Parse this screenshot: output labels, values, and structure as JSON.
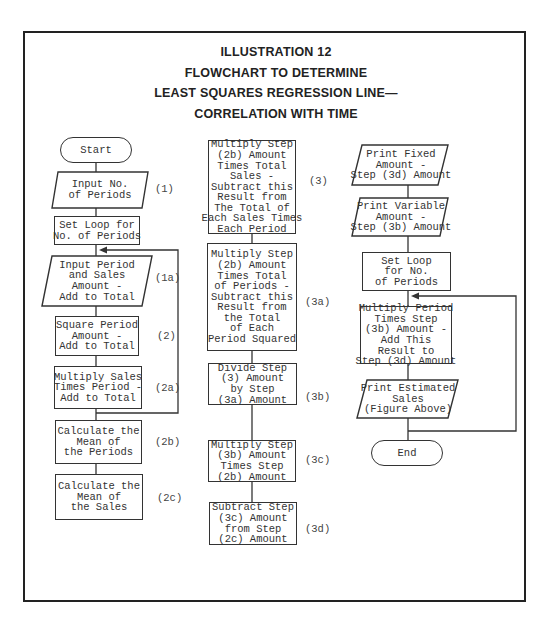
{
  "title": {
    "line1": "ILLUSTRATION 12",
    "line2": "FLOWCHART TO DETERMINE",
    "line3": "LEAST SQUARES REGRESSION LINE—",
    "line4": "CORRELATION WITH TIME"
  },
  "left_column": {
    "start": "Start",
    "input_periods": {
      "text": "Input No.\nof Periods",
      "step": "(1)"
    },
    "set_loop": {
      "text": "Set Loop for\nNo. of Periods"
    },
    "input_period_sales": {
      "text": "Input Period\nand Sales\nAmount -\nAdd to Total",
      "step": "(1a)"
    },
    "square_period": {
      "text": "Square Period\nAmount -\nAdd to Total",
      "step": "(2)"
    },
    "multiply_sales": {
      "text": "Multiply Sales\nTimes Period -\nAdd to Total",
      "step": "(2a)"
    },
    "mean_periods": {
      "text": "Calculate the\nMean of\nthe Periods",
      "step": "(2b)"
    },
    "mean_sales": {
      "text": "Calculate the\nMean of\nthe Sales",
      "step": "(2c)"
    }
  },
  "middle_column": {
    "step3": {
      "text": "Multiply Step\n(2b) Amount\nTimes Total\nSales -\nSubtract this\nResult from\nThe Total of\nEach Sales Times\nEach Period",
      "step": "(3)"
    },
    "step3a": {
      "text": "Multiply Step\n(2b) Amount\nTimes Total\nof Periods -\nSubtract this\nResult from\nthe Total\nof Each\nPeriod Squared",
      "step": "(3a)"
    },
    "step3b": {
      "text": "Divide Step\n(3) Amount\nby Step\n(3a) Amount",
      "step": "(3b)"
    },
    "step3c": {
      "text": "Multiply Step\n(3b) Amount\nTimes Step\n(2b) Amount",
      "step": "(3c)"
    },
    "step3d": {
      "text": "Subtract Step\n(3c) Amount\nfrom Step\n(2c) Amount",
      "step": "(3d)"
    }
  },
  "right_column": {
    "print_fixed": {
      "text": "Print Fixed\nAmount -\nStep (3d) Amount"
    },
    "print_variable": {
      "text": "Print Variable\nAmount -\nStep (3b) Amount"
    },
    "set_loop": {
      "text": "Set Loop\nfor No.\nof Periods"
    },
    "multiply_period": {
      "text": "Multiply Period\nTimes Step\n(3b) Amount -\nAdd This\nResult to\nStep (3d) Amount"
    },
    "print_estimated": {
      "text": "Print Estimated\nSales\n(Figure Above)"
    },
    "end": "End"
  }
}
